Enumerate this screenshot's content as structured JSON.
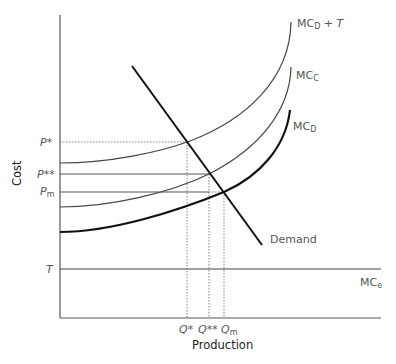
{
  "diagram": {
    "y_axis_label": "Cost",
    "x_axis_label": "Production",
    "y_ticks": {
      "p_star": "P*",
      "p_double_star": "P**",
      "p_m_base": "P",
      "p_m_sub": "m",
      "t": "T"
    },
    "x_ticks": {
      "q_star": "Q*",
      "q_double_star": "Q**",
      "q_m_base": "Q",
      "q_m_sub": "m"
    },
    "curves": {
      "mc_d_plus_t": {
        "base": "MC",
        "sub": "D",
        "suffix": " + T"
      },
      "mc_c": {
        "base": "MC",
        "sub": "C"
      },
      "mc_d": {
        "base": "MC",
        "sub": "D"
      },
      "demand": "Demand",
      "mc_e": {
        "base": "MC",
        "sub": "e"
      }
    },
    "colors": {
      "axis": "#555555",
      "curve": "#444444",
      "mc_d": "#111111",
      "demand": "#111111",
      "guide": "#777777"
    }
  }
}
